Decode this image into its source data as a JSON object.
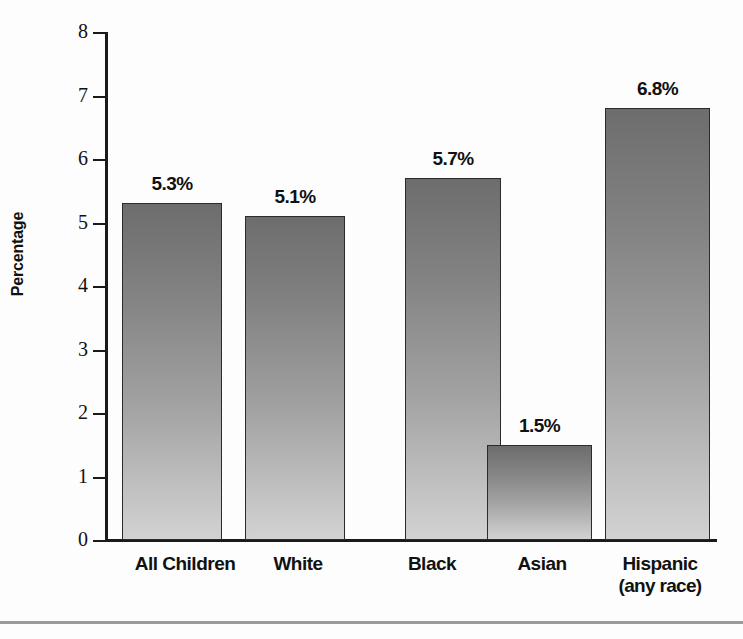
{
  "chart_data": {
    "type": "bar",
    "title": "",
    "xlabel": "",
    "ylabel": "Percentage",
    "ylim": [
      0,
      8
    ],
    "yticks": [
      0,
      1,
      2,
      3,
      4,
      5,
      6,
      7,
      8
    ],
    "ytick_labels": [
      "0",
      "1",
      "2",
      "3",
      "4",
      "5",
      "6",
      "7",
      "8"
    ],
    "grid": false,
    "legend": null,
    "categories": [
      "All Children",
      "White",
      "Black",
      "Asian",
      "Hispanic (any race)"
    ],
    "category_lines": [
      [
        "All Children"
      ],
      [
        "White"
      ],
      [
        "Black"
      ],
      [
        "Asian"
      ],
      [
        "Hispanic",
        "(any race)"
      ]
    ],
    "values": [
      5.3,
      5.1,
      5.7,
      1.5,
      6.8
    ],
    "value_labels": [
      "5.3%",
      "5.1%",
      "5.7%",
      "1.5%",
      "6.8%"
    ],
    "bar_color_top": "#6d6d6d",
    "bar_color_bottom": "#d2d2d2",
    "bar_border_color": "#2b2b2b",
    "axis_color": "#1a1a1a",
    "text_color": "#111111",
    "background_color": "#fdfdfd"
  },
  "axis": {
    "y_title": "Percentage"
  }
}
